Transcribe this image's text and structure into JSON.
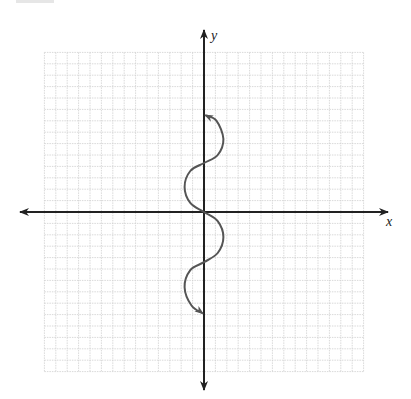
{
  "chart_data": {
    "type": "line",
    "title": "",
    "xlabel": "x",
    "ylabel": "y",
    "grid": true,
    "xlim": [
      -14,
      14
    ],
    "ylim": [
      -14,
      14
    ],
    "axis_arrows": true,
    "tick_labels": [],
    "series": [
      {
        "name": "curve",
        "description": "Curve winding back and forth across the y-axis (x = 1.6·sin-like oscillation along y), with arrowheads at both ends",
        "points": [
          {
            "x": 0.1,
            "y": 8.5
          },
          {
            "x": 1.1,
            "y": 8.0
          },
          {
            "x": 1.7,
            "y": 6.4
          },
          {
            "x": 1.2,
            "y": 5.0
          },
          {
            "x": 0.0,
            "y": 4.3
          },
          {
            "x": -1.2,
            "y": 3.6
          },
          {
            "x": -1.7,
            "y": 2.2
          },
          {
            "x": -1.2,
            "y": 0.8
          },
          {
            "x": 0.0,
            "y": 0.0
          },
          {
            "x": 1.2,
            "y": -0.8
          },
          {
            "x": 1.7,
            "y": -2.2
          },
          {
            "x": 1.2,
            "y": -3.6
          },
          {
            "x": 0.0,
            "y": -4.4
          },
          {
            "x": -1.2,
            "y": -5.1
          },
          {
            "x": -1.7,
            "y": -6.6
          },
          {
            "x": -1.1,
            "y": -8.2
          },
          {
            "x": -0.1,
            "y": -8.9
          }
        ],
        "color": "#555555",
        "start_arrow": true,
        "end_arrow": true
      }
    ]
  },
  "labels": {
    "x_axis": "x",
    "y_axis": "y"
  },
  "colors": {
    "axis": "#222222",
    "grid": "#cfcfcf",
    "curve": "#555555"
  }
}
